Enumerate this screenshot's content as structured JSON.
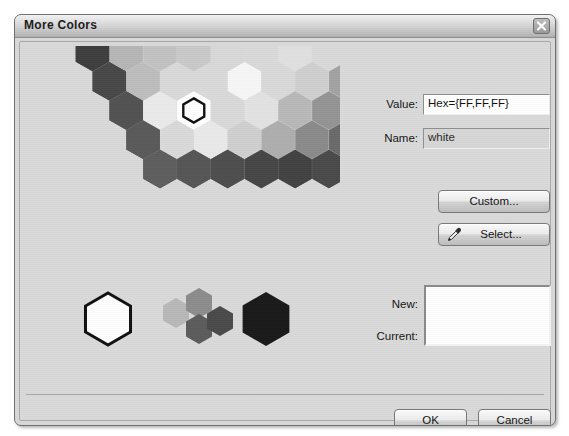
{
  "window": {
    "title": "More Colors",
    "close_icon": "close-x-icon"
  },
  "fields": {
    "value_label": "Value:",
    "value_text": "Hex={FF,FF,FF}",
    "name_label": "Name:",
    "name_text": "white"
  },
  "buttons": {
    "custom": "Custom...",
    "select": "Select...",
    "select_icon": "eyedropper-icon",
    "ok": "OK",
    "cancel": "Cancel"
  },
  "preview": {
    "new_label": "New:",
    "current_label": "Current:",
    "new_color": "#FFFFFF",
    "current_color": "#FFFFFF"
  },
  "palette": {
    "type": "hexagon-color-wheel",
    "selected_color": "#FFFFFF",
    "selected_ring": 1,
    "selected_index": 2,
    "ring_colors": [
      [
        "#ffffff"
      ],
      [
        "#f2f2f2",
        "#e9e9e9",
        "#ffffff",
        "#eaeaea",
        "#dcdcdc",
        "#dedede"
      ],
      [
        "#d4d4d4",
        "#cfcfcf",
        "#e2e2e2",
        "#f6f6f6",
        "#d8d8d8",
        "#c9c9c9",
        "#c2c2c2",
        "#bdbdbd",
        "#c6c6c6",
        "#d2d2d2",
        "#cccccc",
        "#c8c8c8"
      ],
      [
        "#b4b4b4",
        "#aeaeae",
        "#b8b8b8",
        "#cfcfcf",
        "#e0e0e0",
        "#c4c4c4",
        "#acacac",
        "#a4a4a4",
        "#9e9e9e",
        "#a8a8a8",
        "#b0b0b0",
        "#b6b6b6",
        "#aaaaaa",
        "#a6a6a6",
        "#b2b2b2",
        "#bcbcbc",
        "#b8b8b8",
        "#b0b0b0"
      ],
      [
        "#8e8e8e",
        "#8a8a8a",
        "#949494",
        "#a2a2a2",
        "#b6b6b6",
        "#a0a0a0",
        "#8c8c8c",
        "#828282",
        "#7a7a7a",
        "#767676",
        "#808080",
        "#8a8a8a",
        "#909090",
        "#888888",
        "#828282",
        "#868686",
        "#909090",
        "#989898",
        "#949494",
        "#8c8c8c",
        "#868686",
        "#8a8a8a",
        "#909090",
        "#909090"
      ],
      [
        "#6e6e6e",
        "#6a6a6a",
        "#747474",
        "#828282",
        "#8c8c8c",
        "#808080",
        "#6c6c6c",
        "#626262",
        "#5a5a5a",
        "#565656",
        "#606060",
        "#6a6a6a",
        "#707070",
        "#686868",
        "#626262",
        "#666666",
        "#707070",
        "#787878",
        "#747474",
        "#6c6c6c",
        "#666666",
        "#6a6a6a",
        "#707070",
        "#727272",
        "#6e6e6e",
        "#6a6a6a",
        "#666666",
        "#6c6c6c",
        "#747474",
        "#707070"
      ],
      [
        "#525252",
        "#4a4a4a",
        "#3c3c3c",
        "#343434",
        "#3e3e3e",
        "#4a4a4a",
        "#565656",
        "#5a5a5a",
        "#4e4e4e",
        "#424242",
        "#3a3a3a",
        "#444444",
        "#4e4e4e",
        "#585858",
        "#5c5c5c",
        "#545454",
        "#484848",
        "#404040",
        "#3a3a3a",
        "#464646",
        "#505050",
        "#585858",
        "#5e5e5e",
        "#565656",
        "#4c4c4c",
        "#424242",
        "#3e3e3e",
        "#484848",
        "#525252",
        "#5a5a5a",
        "#5e5e5e",
        "#565656",
        "#4e4e4e",
        "#464646",
        "#424242",
        "#4a4a4a"
      ]
    ],
    "bottom_row": [
      {
        "name": "white-swatch",
        "color": "#ffffff",
        "size": "large",
        "selected": true
      },
      {
        "name": "light-gray-swatch",
        "color": "#b8b8b8",
        "size": "small"
      },
      {
        "name": "medium-gray-swatch",
        "color": "#8c8c8c",
        "size": "small"
      },
      {
        "name": "dark-gray-swatch",
        "color": "#5c5c5c",
        "size": "small"
      },
      {
        "name": "darker-gray-swatch",
        "color": "#4a4a4a",
        "size": "small"
      },
      {
        "name": "black-swatch",
        "color": "#1a1a1a",
        "size": "large"
      }
    ]
  }
}
